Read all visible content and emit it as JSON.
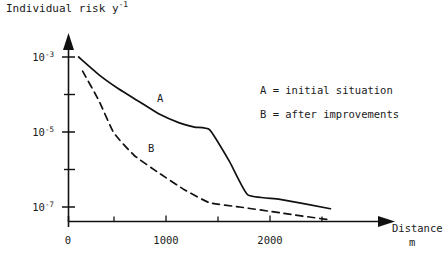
{
  "chart_data": {
    "type": "line",
    "title": "",
    "ylabel": "Individual risk y-1",
    "ylabel_base": "Individual risk y",
    "ylabel_exponent": "-1",
    "xlabel": "Distance",
    "xunit": "m",
    "yscale": "log",
    "xscale": "linear",
    "grid": false,
    "xlim": [
      0,
      2600
    ],
    "ylim": [
      1e-08,
      0.002
    ],
    "xticks": [
      0,
      500,
      1000,
      1500,
      2000,
      2500
    ],
    "xtick_labels": [
      "0",
      "",
      "1000",
      "",
      "2000",
      ""
    ],
    "yticks": [
      0.001,
      0.0001,
      1e-05,
      1e-06,
      1e-07
    ],
    "ytick_labels": [
      "10-3",
      "",
      "10-5",
      "",
      "10-7"
    ],
    "ytick_label_bases": [
      "10",
      "",
      "10",
      "",
      "10"
    ],
    "ytick_label_exponents": [
      "-3",
      "",
      "-5",
      "",
      "-7"
    ],
    "legend_position": "inside-right",
    "series": [
      {
        "name": "A",
        "label": "A = initial situation",
        "style": "solid",
        "color": "#111111",
        "points": [
          [
            100,
            0.001
          ],
          [
            300,
            0.00034
          ],
          [
            500,
            0.00014
          ],
          [
            700,
            6.5e-05
          ],
          [
            900,
            3e-05
          ],
          [
            1100,
            1.75e-05
          ],
          [
            1250,
            1.35e-05
          ],
          [
            1400,
            1.15e-05
          ],
          [
            1600,
            1.6e-06
          ],
          [
            1780,
            2.1e-07
          ],
          [
            2100,
            1.6e-07
          ],
          [
            2600,
            9e-08
          ]
        ]
      },
      {
        "name": "B",
        "label": "B = after improvements",
        "style": "dashed",
        "color": "#111111",
        "points": [
          [
            140,
            0.00042
          ],
          [
            300,
            7e-05
          ],
          [
            450,
            9.5e-06
          ],
          [
            650,
            2.4e-06
          ],
          [
            900,
            8e-07
          ],
          [
            1150,
            2.9e-07
          ],
          [
            1400,
            1.3e-07
          ],
          [
            1700,
            1e-07
          ],
          [
            2100,
            7e-08
          ],
          [
            2600,
            4.5e-08
          ]
        ]
      }
    ],
    "annotations": [
      {
        "text": "A",
        "x": 1150,
        "y": 4.2e-05
      },
      {
        "text": "B",
        "x": 830,
        "y": 8.5e-07
      }
    ]
  },
  "axes": {
    "y_title": "Individual risk y",
    "y_title_exponent": "-1",
    "x_title": "Distance",
    "x_unit": "m"
  },
  "legend": {
    "entry_a": "A = initial situation",
    "entry_b": "B = after improvements"
  },
  "curve_labels": {
    "a": "A",
    "b": "B"
  },
  "ytick_labels": {
    "t0_base": "10",
    "t0_exp": "-3",
    "t1_base": "10",
    "t1_exp": "-5",
    "t2_base": "10",
    "t2_exp": "-7"
  },
  "xtick_labels": {
    "t0": "0",
    "t1": "1000",
    "t2": "2000"
  }
}
